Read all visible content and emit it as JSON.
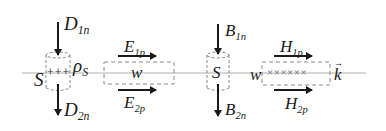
{
  "diagram": {
    "colors": {
      "interface_line": "#b0b0b0",
      "arrows": "#1a1a1a",
      "dashed_boxes": "#8a8a8a",
      "text": "#1a1a1a"
    },
    "labels": {
      "D1n": {
        "base": "D",
        "sub": "1n"
      },
      "D2n": {
        "base": "D",
        "sub": "2n"
      },
      "rhoS": {
        "base": "ρ",
        "sub": "S"
      },
      "S_left": "S",
      "charges": "+++",
      "E1p": {
        "base": "E",
        "sub": "1p"
      },
      "E2p": {
        "base": "E",
        "sub": "2p"
      },
      "w_left": "w",
      "B1n": {
        "base": "B",
        "sub": "1n"
      },
      "B2n": {
        "base": "B",
        "sub": "2n"
      },
      "S_right": "S",
      "w_right": "w",
      "H1p": {
        "base": "H",
        "sub": "1p"
      },
      "H2p": {
        "base": "H",
        "sub": "2p"
      },
      "currents": "××××××",
      "k": "k",
      "k_vec": "→"
    }
  }
}
